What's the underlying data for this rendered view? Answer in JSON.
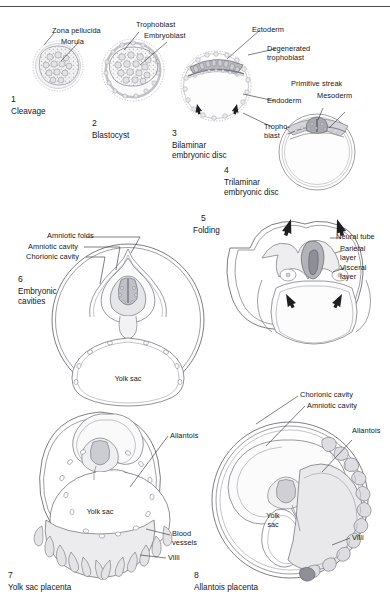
{
  "figure": {
    "background_color": "#ffffff",
    "ink_color": "#17171a",
    "tissue_fill": "#e8e8ea",
    "dark_tissue_fill": "#b9b9bd",
    "top_rule": true
  },
  "panels": [
    {
      "number": "1",
      "caption": "Cleavage",
      "labels": [
        {
          "text": "Zona pellucida",
          "name": "label-zona-pellucida"
        },
        {
          "text": "Morula",
          "name": "label-morula"
        }
      ]
    },
    {
      "number": "2",
      "caption": "Blastocyst",
      "labels": [
        {
          "text": "Trophoblast",
          "name": "label-trophoblast"
        },
        {
          "text": "Embryoblast",
          "name": "label-embryoblast"
        }
      ]
    },
    {
      "number": "3",
      "caption": "Bilaminar embryonic disc",
      "caption_line1": "Bilaminar",
      "caption_line2": "embryonic disc",
      "labels": [
        {
          "text": "Ectoderm",
          "name": "label-ectoderm"
        },
        {
          "text": "Degenerated",
          "name": "label-degenerated-trophoblast-line1"
        },
        {
          "text": "trophoblast",
          "name": "label-degenerated-trophoblast-line2"
        },
        {
          "text": "Endoderm",
          "name": "label-endoderm"
        },
        {
          "text": "Tropho-",
          "name": "label-trophoblast-line1"
        },
        {
          "text": "blast",
          "name": "label-trophoblast-line2"
        }
      ]
    },
    {
      "number": "4",
      "caption": "Trilaminar embryonic disc",
      "caption_line1": "Trilaminar",
      "caption_line2": "embryonic disc",
      "labels": [
        {
          "text": "Primitive streak",
          "name": "label-primitive-streak"
        },
        {
          "text": "Mesoderm",
          "name": "label-mesoderm"
        }
      ]
    },
    {
      "number": "5",
      "caption": "Folding",
      "labels": [
        {
          "text": "Neural tube",
          "name": "label-neural-tube"
        },
        {
          "text": "Parietal",
          "name": "label-parietal-layer-line1"
        },
        {
          "text": "layer",
          "name": "label-parietal-layer-line2"
        },
        {
          "text": "Visceral",
          "name": "label-visceral-layer-line1"
        },
        {
          "text": "layer",
          "name": "label-visceral-layer-line2"
        }
      ]
    },
    {
      "number": "6",
      "caption": "Embryonic cavities",
      "caption_line1": "Embryonic",
      "caption_line2": "cavities",
      "labels": [
        {
          "text": "Amniotic folds",
          "name": "label-amniotic-folds"
        },
        {
          "text": "Amniotic cavity",
          "name": "label-amniotic-cavity"
        },
        {
          "text": "Chorionic cavity",
          "name": "label-chorionic-cavity"
        },
        {
          "text": "Yolk sac",
          "name": "label-yolk-sac"
        }
      ]
    },
    {
      "number": "7",
      "caption": "Yolk sac placenta",
      "labels": [
        {
          "text": "Allantois",
          "name": "label-allantois"
        },
        {
          "text": "Yolk sac",
          "name": "label-yolk-sac"
        },
        {
          "text": "Blood",
          "name": "label-blood-vessels-line1"
        },
        {
          "text": "vessels",
          "name": "label-blood-vessels-line2"
        },
        {
          "text": "Villi",
          "name": "label-villi"
        }
      ]
    },
    {
      "number": "8",
      "caption": "Allantois placenta",
      "labels": [
        {
          "text": "Chorionic cavity",
          "name": "label-chorionic-cavity"
        },
        {
          "text": "Amniotic cavity",
          "name": "label-amniotic-cavity"
        },
        {
          "text": "Allantois",
          "name": "label-allantois"
        },
        {
          "text": "Yolk",
          "name": "label-yolk-sac-line1"
        },
        {
          "text": "sac",
          "name": "label-yolk-sac-line2"
        },
        {
          "text": "Villi",
          "name": "label-villi"
        }
      ]
    }
  ]
}
